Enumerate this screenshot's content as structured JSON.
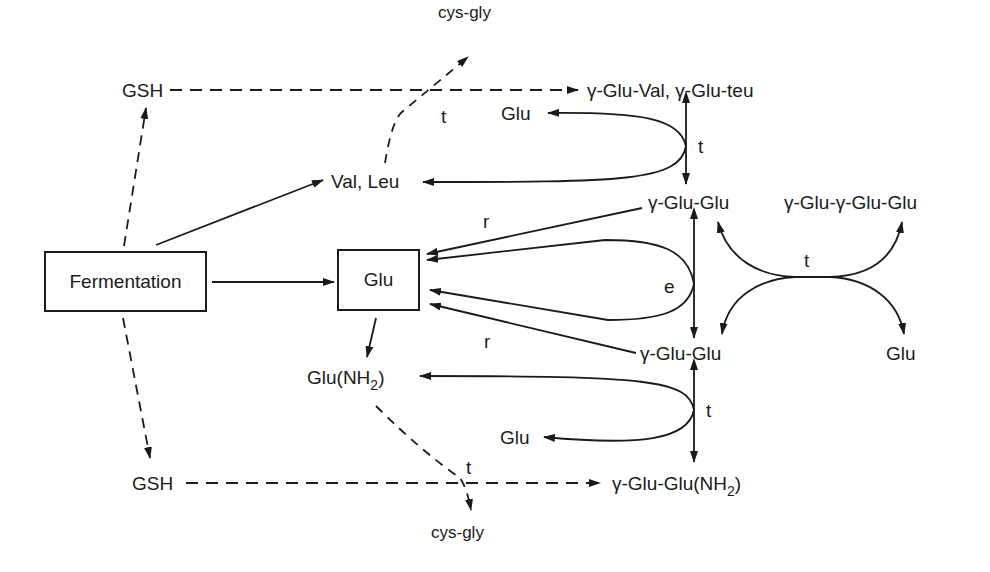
{
  "diagram": {
    "type": "metabolic pathway",
    "nodes": {
      "fermentation": "Fermentation",
      "glu_box": "Glu",
      "gsh_top": "GSH",
      "gsh_bottom": "GSH",
      "cysgly_top": "cys-gly",
      "cysgly_bottom": "cys-gly",
      "val_leu": "Val, Leu",
      "gglu_val_leu": "γ-Glu-Val, γ-Glu-teu",
      "glu_upper_loop": "Glu",
      "gglu_glu_upper": "γ-Glu-Glu",
      "gglu_gglu_glu": "γ-Glu-γ-Glu-Glu",
      "gglu_glu_lower": "γ-Glu-Glu",
      "glu_right": "Glu",
      "glu_nh2_prefix": "Glu(NH",
      "glu_nh2_sub": "2",
      "glu_nh2_suffix": ")",
      "glu_lower_loop": "Glu",
      "gglu_glu_nh2_prefix": "γ-Glu-Glu(NH",
      "gglu_glu_nh2_sub": "2",
      "gglu_glu_nh2_suffix": ")"
    },
    "edge_labels": {
      "t_top_dashed": "t",
      "t_upper_loop": "t",
      "r_upper": "r",
      "e_loop": "e",
      "r_lower": "r",
      "t_cross": "t",
      "t_lower_loop": "t",
      "t_bottom_dashed": "t"
    },
    "edges": [
      {
        "from": "Fermentation",
        "to": "GSH (top)",
        "style": "dashed"
      },
      {
        "from": "Fermentation",
        "to": "GSH (bottom)",
        "style": "dashed"
      },
      {
        "from": "Fermentation",
        "to": "Val, Leu",
        "style": "solid"
      },
      {
        "from": "Fermentation",
        "to": "Glu",
        "style": "solid"
      },
      {
        "from": "GSH (top)",
        "to": "γ-Glu-Val, γ-Glu-teu",
        "style": "dashed"
      },
      {
        "from": "Val, Leu",
        "to": "cys-gly (top)",
        "style": "dashed",
        "label": "t"
      },
      {
        "from": "γ-Glu-Val, γ-Glu-teu",
        "to": "γ-Glu-Glu",
        "style": "solid",
        "label": "t",
        "bidirectional": true
      },
      {
        "from": "upper loop",
        "to": "Glu",
        "style": "solid"
      },
      {
        "from": "upper loop",
        "to": "Val, Leu",
        "style": "solid"
      },
      {
        "from": "γ-Glu-Glu (upper)",
        "to": "Glu",
        "style": "solid",
        "label": "r"
      },
      {
        "from": "e loop",
        "to": "Glu",
        "style": "solid",
        "label": "e"
      },
      {
        "from": "γ-Glu-Glu (lower)",
        "to": "Glu",
        "style": "solid",
        "label": "r"
      },
      {
        "from": "γ-Glu-Glu (upper)",
        "to": "γ-Glu-Glu (lower)",
        "style": "solid",
        "bidirectional": true
      },
      {
        "from": "t cross",
        "to": "γ-Glu-γ-Glu-Glu",
        "style": "solid",
        "label": "t"
      },
      {
        "from": "t cross",
        "to": "Glu (right)",
        "style": "solid"
      },
      {
        "from": "Glu",
        "to": "Glu(NH2)",
        "style": "solid"
      },
      {
        "from": "γ-Glu-Glu (lower)",
        "to": "γ-Glu-Glu(NH2)",
        "style": "solid",
        "label": "t",
        "bidirectional": true
      },
      {
        "from": "lower loop",
        "to": "Glu(NH2)",
        "style": "solid"
      },
      {
        "from": "lower loop",
        "to": "Glu",
        "style": "solid"
      },
      {
        "from": "GSH (bottom)",
        "to": "γ-Glu-Glu(NH2)",
        "style": "dashed"
      },
      {
        "from": "Glu(NH2)",
        "to": "cys-gly (bottom)",
        "style": "dashed",
        "label": "t"
      }
    ],
    "colors": {
      "ink": "#1a1a1a",
      "background": "#ffffff"
    }
  }
}
